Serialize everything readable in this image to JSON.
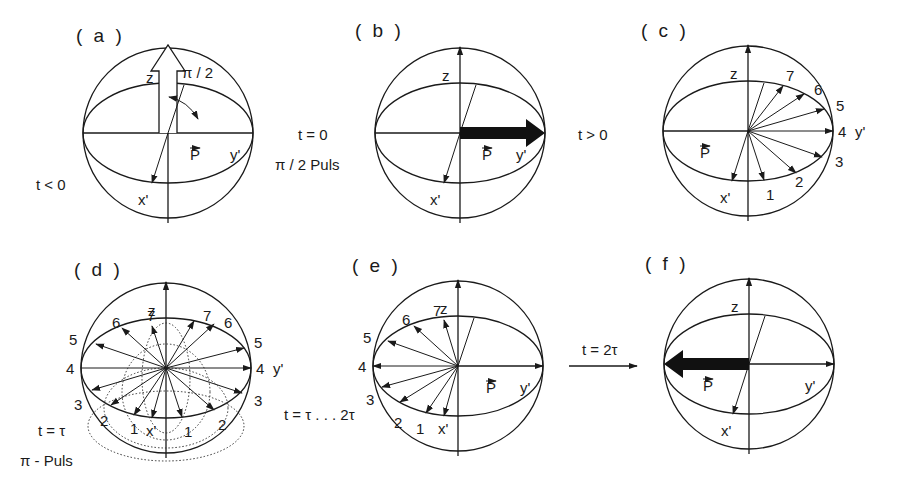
{
  "figure": {
    "panels": [
      {
        "id": "a",
        "label": "( a )",
        "cx": 168,
        "cy": 133,
        "side_text": "t < 0",
        "angle_text": "π / 2",
        "vector_label": "P",
        "axes": {
          "z": "z",
          "x": "x'",
          "y": "y'"
        }
      },
      {
        "id": "b",
        "label": "( b )",
        "cx": 460,
        "cy": 133,
        "vector_label": "P",
        "axes": {
          "z": "z",
          "x": "x'",
          "y": "y'"
        }
      },
      {
        "id": "c",
        "label": "( c )",
        "cx": 748,
        "cy": 131,
        "vector_label": "P",
        "axes": {
          "z": "z",
          "x": "x'",
          "y": "y'"
        },
        "spin_labels": [
          "1",
          "2",
          "3",
          "4",
          "5",
          "6",
          "7"
        ]
      },
      {
        "id": "d",
        "label": "( d )",
        "cx": 166,
        "cy": 368,
        "axes": {
          "z": "z",
          "x": "x'",
          "y": "y'"
        },
        "spin_labels": [
          "1",
          "2",
          "3",
          "4",
          "5",
          "6",
          "7"
        ]
      },
      {
        "id": "e",
        "label": "( e )",
        "cx": 458,
        "cy": 366,
        "vector_label": "P",
        "axes": {
          "z": "z",
          "x": "x'",
          "y": "y'"
        },
        "spin_labels": [
          "1",
          "2",
          "3",
          "4",
          "5",
          "6",
          "7"
        ]
      },
      {
        "id": "f",
        "label": "( f )",
        "cx": 749,
        "cy": 364,
        "vector_label": "P",
        "axes": {
          "z": "z",
          "x": "x'",
          "y": "y'"
        }
      }
    ],
    "transitions": {
      "ab_time": "t = 0",
      "ab_pulse": "π / 2 Puls",
      "bc_time": "t > 0",
      "d_time": "t = τ",
      "d_pulse": "π - Puls",
      "de_time": "t = τ . . . 2τ",
      "ef_time": "t = 2τ"
    },
    "colors": {
      "ink": "#1a1a1a",
      "background": "#ffffff"
    }
  }
}
